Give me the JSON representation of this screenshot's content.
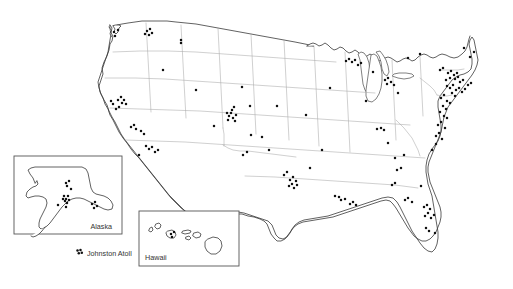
{
  "map": {
    "title": "United States site distribution map",
    "background_color": "#ffffff",
    "coastline_color": "#3a3a3a",
    "state_border_color": "#a8a8a8",
    "marker_color": "#111111",
    "marker_radius": 1.25,
    "width": 513,
    "height": 289
  },
  "insets": {
    "alaska": {
      "label": "Alaska",
      "box": {
        "x": 14,
        "y": 156,
        "width": 108,
        "height": 78
      },
      "label_x": 112,
      "label_y": 229,
      "label_anchor": "end"
    },
    "hawaii": {
      "label": "Hawaii",
      "box": {
        "x": 139,
        "y": 211,
        "width": 100,
        "height": 55
      },
      "label_x": 145,
      "label_y": 260,
      "label_anchor": "start"
    }
  },
  "annotations": {
    "johnston_atoll": {
      "label": "Johnston Atoll",
      "label_x": 87,
      "label_y": 256,
      "marker_cluster": [
        [
          77.5,
          250.5
        ],
        [
          80.5,
          250.0
        ],
        [
          78.8,
          253.2
        ],
        [
          81.8,
          252.8
        ]
      ]
    }
  },
  "markers": {
    "mainland": [
      [
        114,
        32
      ],
      [
        115,
        36
      ],
      [
        118,
        30
      ],
      [
        147,
        31
      ],
      [
        150,
        29
      ],
      [
        152,
        33
      ],
      [
        149,
        35
      ],
      [
        145,
        34
      ],
      [
        181,
        40
      ],
      [
        181,
        43
      ],
      [
        163,
        70
      ],
      [
        111,
        101
      ],
      [
        113,
        104
      ],
      [
        118,
        100
      ],
      [
        121,
        97
      ],
      [
        124,
        100
      ],
      [
        122,
        103
      ],
      [
        126,
        104
      ],
      [
        119,
        107
      ],
      [
        116,
        109
      ],
      [
        131,
        127
      ],
      [
        134,
        125
      ],
      [
        136,
        129
      ],
      [
        141,
        131
      ],
      [
        144,
        134
      ],
      [
        146,
        146
      ],
      [
        149,
        149
      ],
      [
        152,
        147
      ],
      [
        155,
        152
      ],
      [
        158,
        150
      ],
      [
        139,
        155
      ],
      [
        232,
        110
      ],
      [
        234,
        107
      ],
      [
        227,
        113
      ],
      [
        229,
        116
      ],
      [
        231,
        113
      ],
      [
        233,
        118
      ],
      [
        236,
        115
      ],
      [
        228,
        120
      ],
      [
        235,
        121
      ],
      [
        251,
        135
      ],
      [
        196,
        90
      ],
      [
        214,
        126
      ],
      [
        242,
        87
      ],
      [
        243,
        155
      ],
      [
        247,
        152
      ],
      [
        250,
        106
      ],
      [
        262,
        137
      ],
      [
        269,
        150
      ],
      [
        277,
        106
      ],
      [
        284,
        175
      ],
      [
        287,
        172
      ],
      [
        290,
        180
      ],
      [
        293,
        177
      ],
      [
        296,
        181
      ],
      [
        292,
        184
      ],
      [
        289,
        186
      ],
      [
        294,
        188
      ],
      [
        297,
        185
      ],
      [
        306,
        115
      ],
      [
        310,
        168
      ],
      [
        322,
        150
      ],
      [
        330,
        88
      ],
      [
        335,
        196
      ],
      [
        339,
        197
      ],
      [
        341,
        200
      ],
      [
        345,
        199
      ],
      [
        350,
        204
      ],
      [
        353,
        202
      ],
      [
        356,
        205
      ],
      [
        346,
        61
      ],
      [
        349,
        59
      ],
      [
        352,
        62
      ],
      [
        355,
        60
      ],
      [
        358,
        65
      ],
      [
        361,
        63
      ],
      [
        366,
        101
      ],
      [
        377,
        129
      ],
      [
        381,
        128
      ],
      [
        384,
        130
      ],
      [
        388,
        143
      ],
      [
        373,
        72
      ],
      [
        392,
        185
      ],
      [
        395,
        183
      ],
      [
        397,
        170
      ],
      [
        401,
        168
      ],
      [
        395,
        158
      ],
      [
        404,
        155
      ],
      [
        385,
        80
      ],
      [
        388,
        78
      ],
      [
        391,
        82
      ],
      [
        387,
        84
      ],
      [
        394,
        85
      ],
      [
        398,
        93
      ],
      [
        405,
        200
      ],
      [
        408,
        198
      ],
      [
        412,
        202
      ],
      [
        421,
        186
      ],
      [
        424,
        207
      ],
      [
        427,
        205
      ],
      [
        430,
        209
      ],
      [
        428,
        213
      ],
      [
        425,
        216
      ],
      [
        431,
        218
      ],
      [
        434,
        215
      ],
      [
        426,
        228
      ],
      [
        429,
        231
      ],
      [
        435,
        233
      ],
      [
        440,
        70
      ],
      [
        443,
        68
      ],
      [
        448,
        73
      ],
      [
        451,
        71
      ],
      [
        454,
        75
      ],
      [
        457,
        73
      ],
      [
        450,
        78
      ],
      [
        446,
        80
      ],
      [
        455,
        79
      ],
      [
        458,
        77
      ],
      [
        460,
        82
      ],
      [
        463,
        80
      ],
      [
        447,
        86
      ],
      [
        450,
        88
      ],
      [
        453,
        85
      ],
      [
        456,
        90
      ],
      [
        459,
        88
      ],
      [
        462,
        92
      ],
      [
        465,
        89
      ],
      [
        468,
        85
      ],
      [
        471,
        83
      ],
      [
        452,
        93
      ],
      [
        455,
        96
      ],
      [
        444,
        95
      ],
      [
        441,
        98
      ],
      [
        447,
        101
      ],
      [
        450,
        103
      ],
      [
        443,
        106
      ],
      [
        446,
        109
      ],
      [
        440,
        112
      ],
      [
        444,
        116
      ],
      [
        447,
        118
      ],
      [
        441,
        122
      ],
      [
        438,
        125
      ],
      [
        445,
        128
      ],
      [
        439,
        133
      ],
      [
        436,
        136
      ],
      [
        442,
        139
      ],
      [
        436,
        144
      ],
      [
        432,
        150
      ],
      [
        408,
        58
      ],
      [
        420,
        54
      ],
      [
        464,
        48
      ],
      [
        470,
        57
      ],
      [
        474,
        52
      ]
    ],
    "alaska_inset": [
      [
        66,
        183
      ],
      [
        69,
        181
      ],
      [
        67,
        186
      ],
      [
        71,
        189
      ],
      [
        64,
        196
      ],
      [
        66,
        199
      ],
      [
        68,
        196
      ],
      [
        65,
        201
      ],
      [
        67,
        203
      ],
      [
        69,
        200
      ],
      [
        63,
        199
      ],
      [
        58,
        205
      ],
      [
        66,
        207
      ],
      [
        92,
        204
      ],
      [
        95,
        202
      ],
      [
        97,
        206
      ],
      [
        94,
        208
      ]
    ],
    "hawaii_inset": [
      [
        171,
        234
      ],
      [
        174,
        232
      ],
      [
        172,
        237
      ]
    ]
  }
}
